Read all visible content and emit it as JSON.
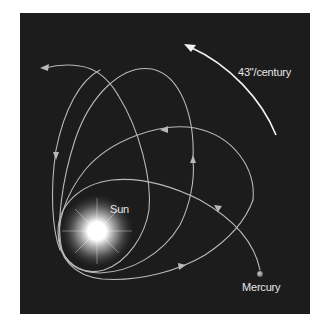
{
  "diagram": {
    "background_color": "#1c1c1c",
    "orbit_color": "#b9b9b9",
    "labels": {
      "sun": "Sun",
      "precession_rate": "43\"/century",
      "planet": "Mercury"
    },
    "bodies": [
      {
        "name": "Sun",
        "x": 97,
        "y": 231,
        "glow_radius": 36
      },
      {
        "name": "Mercury",
        "x": 260,
        "y": 274,
        "radius": 3
      }
    ],
    "orbits": [
      {
        "id": "orbit-1",
        "description": "earliest orbit, lowest, starting at Mercury"
      },
      {
        "id": "orbit-2",
        "description": "second orbit, rotated counter-clockwise"
      },
      {
        "id": "orbit-3",
        "description": "third orbit, nearly vertical"
      },
      {
        "id": "orbit-4",
        "description": "fourth orbit, tilted to upper-left, ends with arrow"
      }
    ],
    "precession_arrow": {
      "direction": "counter-clockwise",
      "label": "43\"/century"
    }
  }
}
